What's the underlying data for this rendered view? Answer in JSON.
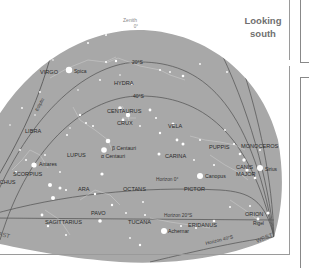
{
  "title": {
    "line1": "Looking",
    "line2": "south"
  },
  "colors": {
    "sky": "#a8a8a8",
    "line": "#5a5a5a",
    "label": "#2a2a2a",
    "star": "#ffffff",
    "title": "#707070"
  },
  "zenith": {
    "label": "Zenith",
    "value": "0°"
  },
  "altitude_lines": [
    {
      "label": "20°S"
    },
    {
      "label": "40°S"
    }
  ],
  "horizons": [
    {
      "label": "Horizon 0°"
    },
    {
      "label": "Horizon 20°S"
    },
    {
      "label": "Horizon 40°S"
    }
  ],
  "ecliptic_label": "Ecliptic",
  "directions": {
    "east": "EAST",
    "west": "WEST"
  },
  "constellations": [
    {
      "name": "VIRGO"
    },
    {
      "name": "HYDRA"
    },
    {
      "name": "CENTAURUS"
    },
    {
      "name": "CRUX"
    },
    {
      "name": "LIBRA"
    },
    {
      "name": "LUPUS"
    },
    {
      "name": "VELA"
    },
    {
      "name": "CARINA"
    },
    {
      "name": "PUPPIS"
    },
    {
      "name": "MONOCEROS"
    },
    {
      "name": "CANIS"
    },
    {
      "name": "MAJOR"
    },
    {
      "name": "SCORPIUS"
    },
    {
      "name": "OPHIUCHUS"
    },
    {
      "name": "ARA"
    },
    {
      "name": "OCTANS"
    },
    {
      "name": "PICTOR"
    },
    {
      "name": "PAVO"
    },
    {
      "name": "SAGITTARIUS"
    },
    {
      "name": "TUCANA"
    },
    {
      "name": "ERIDANUS"
    },
    {
      "name": "ORION"
    }
  ],
  "stars": [
    {
      "name": "Spica"
    },
    {
      "name": "β Centauri"
    },
    {
      "name": "α Centauri"
    },
    {
      "name": "Antares"
    },
    {
      "name": "Canopus"
    },
    {
      "name": "Sirius"
    },
    {
      "name": "Achernar"
    },
    {
      "name": "Rigel"
    }
  ]
}
